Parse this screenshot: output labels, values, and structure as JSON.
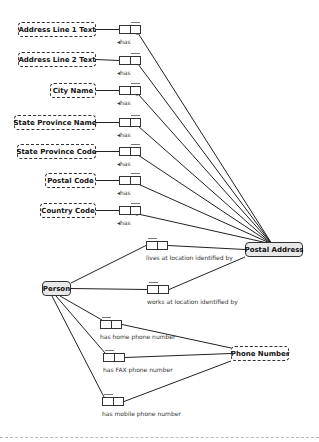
{
  "diagram": {
    "value_types": [
      {
        "id": "addr1",
        "label": "Address Line 1 Text",
        "x": 18,
        "y": 22,
        "w": 78
      },
      {
        "id": "addr2",
        "label": "Address Line 2 Text",
        "x": 18,
        "y": 52,
        "w": 78
      },
      {
        "id": "city",
        "label": "City Name",
        "x": 50,
        "y": 83,
        "w": 46
      },
      {
        "id": "spname",
        "label": "State Province Name",
        "x": 14,
        "y": 115,
        "w": 82
      },
      {
        "id": "spcode",
        "label": "State Province Code",
        "x": 17,
        "y": 144,
        "w": 79
      },
      {
        "id": "postal",
        "label": "Postal Code",
        "x": 45,
        "y": 173,
        "w": 51
      },
      {
        "id": "country",
        "label": "Country Code",
        "x": 40,
        "y": 203,
        "w": 56
      }
    ],
    "entities": {
      "postal_address": {
        "label": "Postal Address",
        "x": 245,
        "y": 242,
        "w": 58
      },
      "person": {
        "label": "Person",
        "x": 42,
        "y": 281,
        "w": 29
      },
      "phone_number": {
        "label": "Phone Number",
        "x": 231,
        "y": 346,
        "w": 58
      }
    },
    "address_roles": [
      {
        "label": "has",
        "x": 119,
        "y": 25
      },
      {
        "label": "has",
        "x": 119,
        "y": 56
      },
      {
        "label": "has",
        "x": 119,
        "y": 86
      },
      {
        "label": "has",
        "x": 119,
        "y": 118
      },
      {
        "label": "has",
        "x": 119,
        "y": 147
      },
      {
        "label": "has",
        "x": 119,
        "y": 176
      },
      {
        "label": "has",
        "x": 119,
        "y": 206
      }
    ],
    "person_roles": [
      {
        "label": "lives at location identified by",
        "x": 146,
        "y": 241,
        "target": "postal_address"
      },
      {
        "label": "works at location identified by",
        "x": 147,
        "y": 285,
        "target": "postal_address"
      },
      {
        "label": "has home phone number",
        "x": 100,
        "y": 320,
        "target": "phone_number"
      },
      {
        "label": "has FAX phone number",
        "x": 103,
        "y": 353,
        "target": "phone_number"
      },
      {
        "label": "has mobile phone number",
        "x": 102,
        "y": 397,
        "target": "phone_number"
      }
    ],
    "has_arrow_glyph": "◂"
  }
}
